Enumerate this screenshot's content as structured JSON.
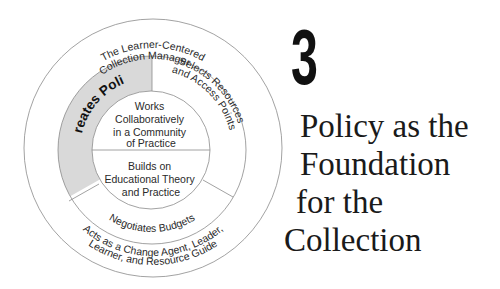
{
  "diagram": {
    "outer_ring": {
      "top_label": "The Learner-Centered Collection Manager . . .",
      "top_label_lines": [
        "The Learner-Centered",
        "Collection Manager . . ."
      ],
      "bottom_label_lines": [
        "Acts as a Change Agent, Leader,",
        "Learner, and Resource Guide"
      ]
    },
    "middle_ring": {
      "segments": [
        {
          "label": "Creates Policy",
          "highlighted": true
        },
        {
          "label_lines": [
            "Selects Resources",
            "and Access Points"
          ],
          "highlighted": false
        },
        {
          "label": "Negotiates Budgets",
          "highlighted": false
        }
      ]
    },
    "inner_circle": {
      "top_lines": [
        "Works",
        "Collaboratively",
        "in a Community",
        "of Practice"
      ],
      "bottom_lines": [
        "Builds on",
        "Educational Theory",
        "and Practice"
      ]
    },
    "colors": {
      "highlight_fill": "#d9d9d9",
      "line": "#8a8a8a",
      "text": "#2a2a2a"
    }
  },
  "chapter": {
    "number": "3",
    "title_lines": [
      "Policy as the",
      "Foundation",
      "for the",
      "Collection"
    ]
  }
}
